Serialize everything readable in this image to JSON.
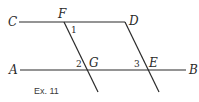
{
  "diagram": {
    "caption": "Ex. 11",
    "points": {
      "C": "C",
      "F": "F",
      "D": "D",
      "A": "A",
      "G": "G",
      "E": "E",
      "B": "B"
    },
    "angles": {
      "a1": "1",
      "a2": "2",
      "a3": "3"
    },
    "lines": [
      {
        "name": "CD",
        "from": [
          19,
          22
        ],
        "to": [
          125,
          22
        ]
      },
      {
        "name": "AB",
        "from": [
          20,
          70
        ],
        "to": [
          186,
          70
        ]
      },
      {
        "name": "FG-transversal",
        "from": [
          64,
          22
        ],
        "to": [
          98,
          92
        ]
      },
      {
        "name": "DE-transversal",
        "from": [
          125,
          22
        ],
        "to": [
          159,
          92
        ]
      }
    ],
    "colors": {
      "stroke": "#2a2a2a",
      "background": "#ffffff"
    }
  }
}
